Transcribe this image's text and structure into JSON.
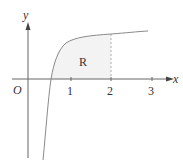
{
  "figure": {
    "axes": {
      "x_label": "x",
      "y_label": "y",
      "origin_label": "O",
      "x_ticks": [
        "1",
        "2",
        "3"
      ]
    },
    "region": {
      "label": "R",
      "bounded_right_at": "2",
      "fill_color": "#f3f3f3"
    },
    "colors": {
      "axis": "#666666",
      "curve": "#8a8a8a",
      "dashed": "#999999"
    }
  }
}
